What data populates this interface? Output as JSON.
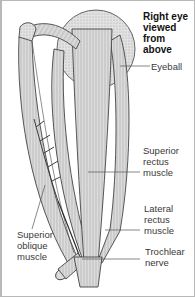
{
  "diagram": {
    "title_lines": [
      "Right eye",
      "viewed",
      "from",
      "above"
    ],
    "labels": {
      "eyeball": [
        "Eyeball"
      ],
      "superior_rectus": [
        "Superior",
        "rectus",
        "muscle"
      ],
      "lateral_rectus": [
        "Lateral",
        "rectus",
        "muscle"
      ],
      "superior_oblique": [
        "Superior",
        "oblique",
        "muscle"
      ],
      "trochlear_nerve": [
        "Trochlear",
        "nerve"
      ]
    },
    "colors": {
      "outline": "#3a3a3a",
      "muscle_fill": "#d9d9d9",
      "eyeball_fill": "#ececec",
      "border": "#b8b8b8"
    }
  }
}
